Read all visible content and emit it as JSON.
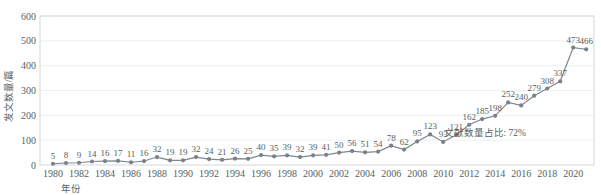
{
  "chart_data": {
    "type": "line",
    "title": "",
    "subtitle": "",
    "xlabel": "年份",
    "ylabel": "发文数量/篇",
    "xlim": [
      1979,
      2021.6
    ],
    "ylim": [
      0,
      600
    ],
    "grid": true,
    "legend": "none",
    "x": [
      1980,
      1981,
      1982,
      1983,
      1984,
      1985,
      1986,
      1987,
      1988,
      1989,
      1990,
      1991,
      1992,
      1993,
      1994,
      1995,
      1996,
      1997,
      1998,
      1999,
      2000,
      2001,
      2002,
      2003,
      2004,
      2005,
      2006,
      2007,
      2008,
      2009,
      2010,
      2011,
      2012,
      2013,
      2014,
      2015,
      2016,
      2017,
      2018,
      2019,
      2020,
      2021
    ],
    "values": [
      5,
      8,
      9,
      14,
      16,
      17,
      11,
      16,
      32,
      19,
      19,
      32,
      24,
      21,
      26,
      25,
      40,
      35,
      39,
      32,
      39,
      41,
      50,
      56,
      51,
      54,
      78,
      62,
      95,
      123,
      93,
      121,
      162,
      185,
      198,
      252,
      240,
      279,
      308,
      337,
      473,
      466
    ],
    "xticks": [
      1980,
      1982,
      1984,
      1986,
      1988,
      1990,
      1992,
      1994,
      1996,
      1998,
      2000,
      2002,
      2004,
      2006,
      2008,
      2010,
      2012,
      2014,
      2016,
      2018,
      2020
    ],
    "yticks": [
      0,
      100,
      200,
      300,
      400,
      500,
      600
    ],
    "annotations": [
      {
        "name": "share-annotation",
        "text": "文献数量占比: 72%",
        "x": 2013.2,
        "y": 118
      }
    ],
    "series_color": "#7d868b",
    "grid_color": "#e8ecee",
    "text_color": "#555f63"
  },
  "axes": {
    "y_axis_title": "发文数量/篇",
    "x_axis_title": "年份"
  }
}
